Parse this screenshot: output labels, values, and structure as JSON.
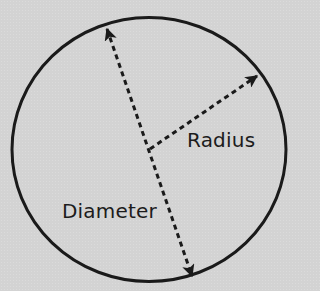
{
  "diagram": {
    "colors": {
      "background": "#d3d3d3",
      "stroke": "#1a1a1a",
      "text": "#1c1c1c"
    },
    "circle": {
      "cx": 149,
      "cy": 149.5,
      "rx": 137,
      "ry": 132,
      "stroke_width": 3
    },
    "center": {
      "x": 150,
      "y": 149
    },
    "diameter": {
      "label": "Diameter",
      "start": {
        "x": 107,
        "y": 29
      },
      "end": {
        "x": 192,
        "y": 276
      },
      "style": "dashed",
      "arrowheads": "both"
    },
    "radius": {
      "label": "Radius",
      "start": {
        "x": 150,
        "y": 149
      },
      "end": {
        "x": 257,
        "y": 76
      },
      "style": "dashed",
      "arrowheads": "end"
    }
  }
}
